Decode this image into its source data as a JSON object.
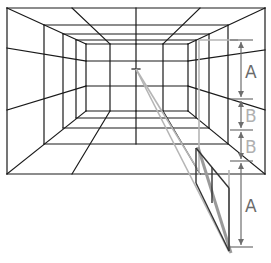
{
  "diagram": {
    "vanishing_point": {
      "x": 136,
      "y": 69
    },
    "labels": [
      {
        "id": "A-top",
        "text": "A"
      },
      {
        "id": "B-upper",
        "text": "B"
      },
      {
        "id": "B-lower",
        "text": "B"
      },
      {
        "id": "A-bottom",
        "text": "A"
      }
    ],
    "colors": {
      "grid_lines": "#1a1a1a",
      "construction_lines": "#b5b5b5",
      "measure_lines": "#6e6e6e",
      "label_dark": "#6a6a6a",
      "label_light": "#b0b0b0"
    }
  }
}
